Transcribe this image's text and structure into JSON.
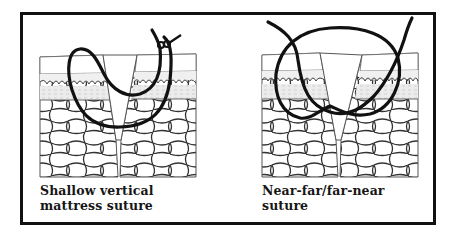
{
  "figure": {
    "panels": [
      {
        "id": "left",
        "caption_line1": "Shallow vertical",
        "caption_line2": "mattress suture"
      },
      {
        "id": "right",
        "caption_line1": "Near-far/far-near",
        "caption_line2": "suture"
      }
    ],
    "colors": {
      "ink": "#111111",
      "tissue_line": "#555555",
      "dermis_shade": "#e6e6e6",
      "background": "#ffffff"
    }
  }
}
